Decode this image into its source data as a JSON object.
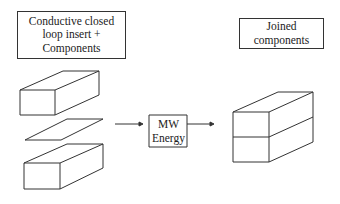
{
  "diagram": {
    "input_label": {
      "lines": [
        "Conductive closed",
        "loop insert +",
        "Components"
      ]
    },
    "process_label": {
      "lines": [
        "MW",
        "Energy"
      ]
    },
    "output_label": {
      "lines": [
        "Joined",
        "components"
      ]
    },
    "parts": [
      "top-component-block",
      "conductive-insert-plate",
      "bottom-component-block"
    ],
    "result": "joined-stacked-block",
    "colors": {
      "stroke": "#333333",
      "background": "#ffffff",
      "text": "#222222"
    }
  }
}
